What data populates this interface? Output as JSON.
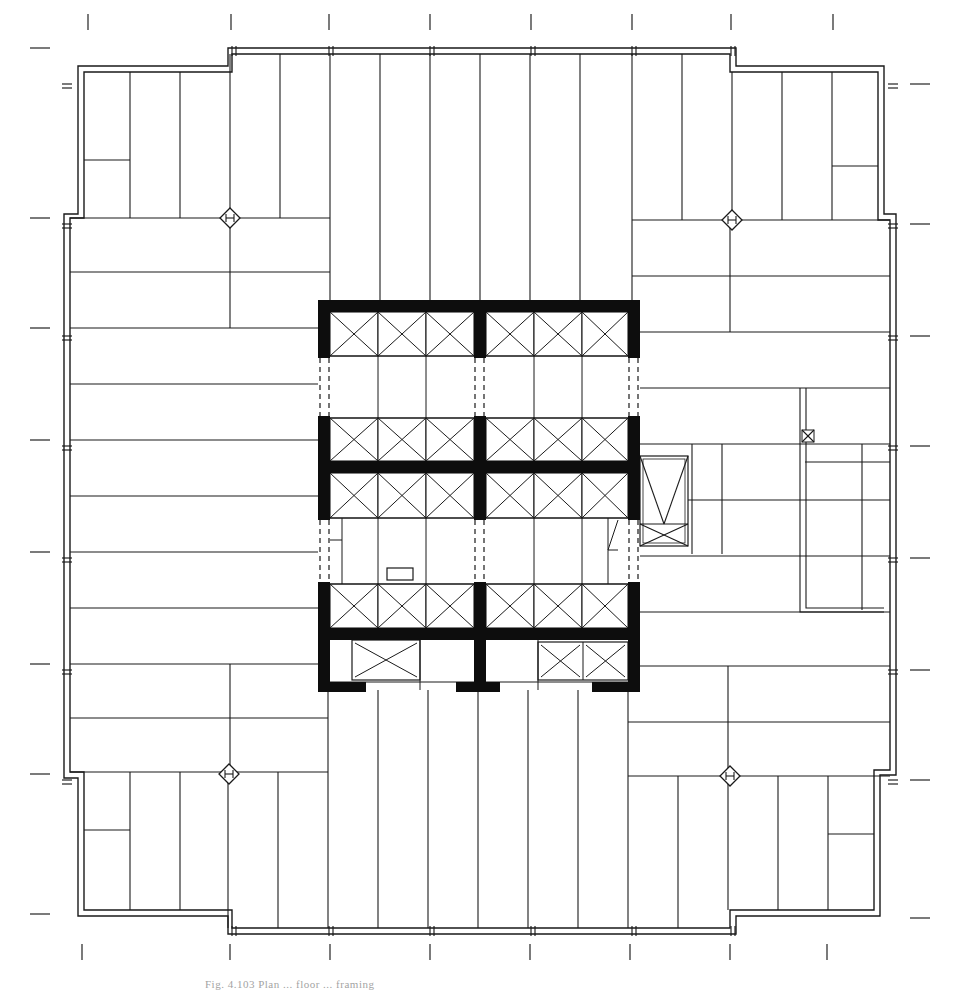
{
  "figure": {
    "caption": "Fig. 4.103  Plan ... floor ... framing",
    "colors": {
      "line": "#1a1a1a",
      "core_wall": "#0d0d0d",
      "background": "#ffffff"
    },
    "icons": {
      "column_marker": "diamond-column-icon",
      "elevator_shaft": "x-box-elevator-icon",
      "small_shaft": "x-box-small-icon"
    }
  },
  "plan": {
    "outer_outline": [
      [
        64,
        214
      ],
      [
        64,
        778
      ],
      [
        78,
        778
      ],
      [
        78,
        916
      ],
      [
        228,
        916
      ],
      [
        228,
        934
      ],
      [
        736,
        934
      ],
      [
        736,
        916
      ],
      [
        880,
        916
      ],
      [
        880,
        775
      ],
      [
        896,
        775
      ],
      [
        896,
        214
      ],
      [
        884,
        214
      ],
      [
        884,
        66
      ],
      [
        736,
        66
      ],
      [
        736,
        48
      ],
      [
        228,
        48
      ],
      [
        228,
        66
      ],
      [
        78,
        66
      ],
      [
        78,
        214
      ]
    ],
    "inner_outline": [
      [
        70,
        218
      ],
      [
        70,
        772
      ],
      [
        84,
        772
      ],
      [
        84,
        910
      ],
      [
        232,
        910
      ],
      [
        232,
        928
      ],
      [
        730,
        928
      ],
      [
        730,
        910
      ],
      [
        874,
        910
      ],
      [
        874,
        770
      ],
      [
        890,
        770
      ],
      [
        890,
        220
      ],
      [
        878,
        220
      ],
      [
        878,
        72
      ],
      [
        730,
        72
      ],
      [
        730,
        54
      ],
      [
        232,
        54
      ],
      [
        232,
        72
      ],
      [
        84,
        72
      ],
      [
        84,
        218
      ]
    ],
    "joists_vertical": [
      {
        "x": 130,
        "y1": 72,
        "y2": 218
      },
      {
        "x": 180,
        "y1": 72,
        "y2": 218
      },
      {
        "x": 230,
        "y1": 54,
        "y2": 218
      },
      {
        "x": 280,
        "y1": 54,
        "y2": 218
      },
      {
        "x": 330,
        "y1": 54,
        "y2": 304
      },
      {
        "x": 380,
        "y1": 54,
        "y2": 304
      },
      {
        "x": 430,
        "y1": 54,
        "y2": 304
      },
      {
        "x": 480,
        "y1": 54,
        "y2": 304
      },
      {
        "x": 530,
        "y1": 54,
        "y2": 304
      },
      {
        "x": 580,
        "y1": 54,
        "y2": 304
      },
      {
        "x": 632,
        "y1": 54,
        "y2": 304
      },
      {
        "x": 682,
        "y1": 54,
        "y2": 220
      },
      {
        "x": 732,
        "y1": 72,
        "y2": 220
      },
      {
        "x": 782,
        "y1": 72,
        "y2": 220
      },
      {
        "x": 832,
        "y1": 72,
        "y2": 220
      },
      {
        "x": 130,
        "y1": 772,
        "y2": 910
      },
      {
        "x": 180,
        "y1": 772,
        "y2": 910
      },
      {
        "x": 228,
        "y1": 772,
        "y2": 928
      },
      {
        "x": 278,
        "y1": 772,
        "y2": 928
      },
      {
        "x": 328,
        "y1": 690,
        "y2": 928
      },
      {
        "x": 378,
        "y1": 690,
        "y2": 928
      },
      {
        "x": 428,
        "y1": 690,
        "y2": 928
      },
      {
        "x": 478,
        "y1": 690,
        "y2": 928
      },
      {
        "x": 528,
        "y1": 690,
        "y2": 928
      },
      {
        "x": 578,
        "y1": 690,
        "y2": 928
      },
      {
        "x": 628,
        "y1": 690,
        "y2": 928
      },
      {
        "x": 678,
        "y1": 776,
        "y2": 928
      },
      {
        "x": 728,
        "y1": 776,
        "y2": 910
      },
      {
        "x": 778,
        "y1": 776,
        "y2": 910
      },
      {
        "x": 828,
        "y1": 776,
        "y2": 910
      },
      {
        "x": 230,
        "y1": 218,
        "y2": 328
      },
      {
        "x": 730,
        "y1": 220,
        "y2": 332
      },
      {
        "x": 230,
        "y1": 664,
        "y2": 772
      },
      {
        "x": 728,
        "y1": 666,
        "y2": 776
      },
      {
        "x": 692,
        "y1": 444,
        "y2": 554
      },
      {
        "x": 722,
        "y1": 444,
        "y2": 554
      },
      {
        "x": 862,
        "y1": 444,
        "y2": 610
      }
    ],
    "joists_horizontal": [
      {
        "y": 160,
        "x1": 84,
        "x2": 130
      },
      {
        "y": 166,
        "x1": 832,
        "x2": 878
      },
      {
        "y": 830,
        "x1": 84,
        "x2": 130
      },
      {
        "y": 834,
        "x1": 828,
        "x2": 874
      },
      {
        "y": 218,
        "x1": 70,
        "x2": 330
      },
      {
        "y": 272,
        "x1": 70,
        "x2": 330
      },
      {
        "y": 328,
        "x1": 70,
        "x2": 318
      },
      {
        "y": 384,
        "x1": 70,
        "x2": 318
      },
      {
        "y": 440,
        "x1": 70,
        "x2": 318
      },
      {
        "y": 496,
        "x1": 70,
        "x2": 318
      },
      {
        "y": 552,
        "x1": 70,
        "x2": 318
      },
      {
        "y": 608,
        "x1": 70,
        "x2": 318
      },
      {
        "y": 664,
        "x1": 70,
        "x2": 318
      },
      {
        "y": 718,
        "x1": 70,
        "x2": 328
      },
      {
        "y": 772,
        "x1": 70,
        "x2": 328
      },
      {
        "y": 220,
        "x1": 632,
        "x2": 890
      },
      {
        "y": 276,
        "x1": 632,
        "x2": 890
      },
      {
        "y": 332,
        "x1": 640,
        "x2": 890
      },
      {
        "y": 388,
        "x1": 640,
        "x2": 890
      },
      {
        "y": 444,
        "x1": 640,
        "x2": 890
      },
      {
        "y": 500,
        "x1": 640,
        "x2": 890
      },
      {
        "y": 556,
        "x1": 640,
        "x2": 890
      },
      {
        "y": 612,
        "x1": 640,
        "x2": 890
      },
      {
        "y": 666,
        "x1": 640,
        "x2": 890
      },
      {
        "y": 722,
        "x1": 628,
        "x2": 890
      },
      {
        "y": 776,
        "x1": 628,
        "x2": 890
      },
      {
        "y": 462,
        "x1": 805,
        "x2": 890
      }
    ],
    "column_markers": [
      [
        230,
        218
      ],
      [
        732,
        220
      ],
      [
        229,
        774
      ],
      [
        730,
        776
      ]
    ],
    "core": {
      "x": 318,
      "y": 300,
      "w": 322,
      "h": 392,
      "mid_x": 479,
      "walls": [
        {
          "x": 318,
          "y": 300,
          "w": 322,
          "h": 12
        },
        {
          "x": 318,
          "y": 300,
          "w": 12,
          "h": 58
        },
        {
          "x": 474,
          "y": 300,
          "w": 12,
          "h": 58
        },
        {
          "x": 628,
          "y": 300,
          "w": 12,
          "h": 58
        },
        {
          "x": 318,
          "y": 416,
          "w": 12,
          "h": 104
        },
        {
          "x": 474,
          "y": 416,
          "w": 12,
          "h": 104
        },
        {
          "x": 628,
          "y": 416,
          "w": 12,
          "h": 104
        },
        {
          "x": 318,
          "y": 461,
          "w": 322,
          "h": 12
        },
        {
          "x": 318,
          "y": 582,
          "w": 12,
          "h": 110
        },
        {
          "x": 474,
          "y": 582,
          "w": 12,
          "h": 110
        },
        {
          "x": 628,
          "y": 582,
          "w": 12,
          "h": 110
        },
        {
          "x": 318,
          "y": 628,
          "w": 322,
          "h": 12
        },
        {
          "x": 318,
          "y": 682,
          "w": 48,
          "h": 10
        },
        {
          "x": 456,
          "y": 682,
          "w": 44,
          "h": 10
        },
        {
          "x": 592,
          "y": 682,
          "w": 48,
          "h": 10
        }
      ],
      "shaft_rows": [
        {
          "y1": 312,
          "y2": 356
        },
        {
          "y1": 418,
          "y2": 461
        },
        {
          "y1": 473,
          "y2": 518
        },
        {
          "y1": 584,
          "y2": 628
        }
      ],
      "shaft_cols": [
        [
          330,
          378
        ],
        [
          378,
          426
        ],
        [
          426,
          474
        ],
        [
          486,
          534
        ],
        [
          534,
          582
        ],
        [
          582,
          628
        ]
      ],
      "lower_shafts": [
        {
          "x": 352,
          "y": 640,
          "w": 68,
          "h": 40,
          "cells": 1
        },
        {
          "x": 538,
          "y": 642,
          "w": 90,
          "h": 38,
          "cells": 2
        }
      ],
      "dashed_gaps": [
        [
          320,
          358,
          416
        ],
        [
          329,
          358,
          416
        ],
        [
          475,
          358,
          416
        ],
        [
          484,
          358,
          416
        ],
        [
          629,
          358,
          416
        ],
        [
          638,
          358,
          416
        ],
        [
          320,
          520,
          582
        ],
        [
          329,
          520,
          582
        ],
        [
          475,
          520,
          582
        ],
        [
          484,
          520,
          582
        ],
        [
          629,
          520,
          582
        ],
        [
          638,
          520,
          582
        ]
      ],
      "gap_verticals": [
        [
          378,
          356,
          418
        ],
        [
          426,
          356,
          418
        ],
        [
          534,
          356,
          418
        ],
        [
          582,
          356,
          418
        ],
        [
          378,
          518,
          584
        ],
        [
          426,
          518,
          584
        ],
        [
          534,
          518,
          584
        ],
        [
          582,
          518,
          584
        ],
        [
          342,
          518,
          584
        ],
        [
          608,
          518,
          584
        ]
      ],
      "small_box": {
        "x": 387,
        "y": 568,
        "w": 26,
        "h": 12
      }
    },
    "side_stair": {
      "x": 640,
      "y": 456,
      "w": 48,
      "h": 90
    },
    "right_notch": {
      "x1": 800,
      "y1": 388,
      "x2": 806,
      "y2": 612,
      "x3": 884
    },
    "small_xbox": {
      "x": 802,
      "y": 430,
      "w": 12,
      "h": 12
    },
    "grid_ticks_top": [
      88,
      231,
      329,
      430,
      531,
      632,
      731,
      833
    ],
    "grid_ticks_bottom": [
      82,
      230,
      330,
      430,
      530,
      630,
      730,
      827
    ],
    "grid_ticks_left": [
      48,
      218,
      328,
      440,
      552,
      664,
      774,
      914
    ],
    "grid_ticks_right": [
      84,
      224,
      336,
      446,
      558,
      670,
      780,
      918
    ]
  }
}
